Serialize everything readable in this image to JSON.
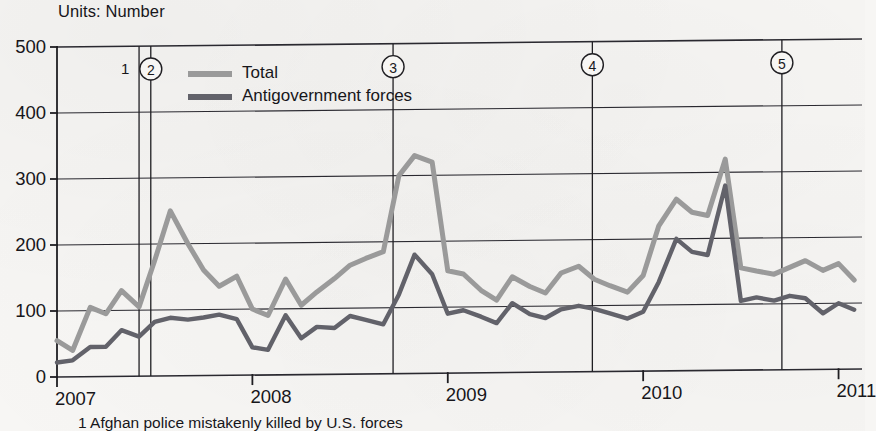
{
  "units_label": "Units: Number",
  "footnote": "1 Afghan police mistakenly killed by U.S. forces",
  "colors": {
    "total_line": "#9a9a9a",
    "antigovernment_line": "#62626a",
    "axis": "#1f1e22",
    "grid": "#2a2930",
    "text": "#17161a",
    "background": "#f7f6f4"
  },
  "legend": {
    "items": [
      {
        "label": "Total",
        "color": "#9a9a9a"
      },
      {
        "label": "Antigovernment forces",
        "color": "#62626a"
      }
    ]
  },
  "annotations": [
    {
      "id": "1",
      "circled": false,
      "x_value": 2007.42
    },
    {
      "id": "2",
      "circled": true,
      "x_value": 2007.48
    },
    {
      "id": "3",
      "circled": true,
      "x_value": 2008.72
    },
    {
      "id": "4",
      "circled": true,
      "x_value": 2009.74
    },
    {
      "id": "5",
      "circled": true,
      "x_value": 2010.71
    }
  ],
  "chart_data": {
    "type": "line",
    "title": "",
    "subtitle": "",
    "xlabel": "",
    "ylabel": "",
    "ylim": [
      0,
      500
    ],
    "xlim": [
      2007.0,
      2011.12
    ],
    "ytick_labels": [
      "0",
      "100",
      "200",
      "300",
      "400",
      "500"
    ],
    "ytick_values": [
      0,
      100,
      200,
      300,
      400,
      500
    ],
    "xtick_labels": [
      "2007",
      "2008",
      "2009",
      "2010",
      "2011"
    ],
    "xtick_values": [
      2007,
      2008,
      2009,
      2010,
      2011
    ],
    "grid": true,
    "legend_position": "top-center",
    "x": [
      2007.0,
      2007.08,
      2007.17,
      2007.25,
      2007.33,
      2007.42,
      2007.5,
      2007.58,
      2007.67,
      2007.75,
      2007.83,
      2007.92,
      2008.0,
      2008.08,
      2008.17,
      2008.25,
      2008.33,
      2008.42,
      2008.5,
      2008.58,
      2008.67,
      2008.75,
      2008.83,
      2008.92,
      2009.0,
      2009.08,
      2009.17,
      2009.25,
      2009.33,
      2009.42,
      2009.5,
      2009.58,
      2009.67,
      2009.75,
      2009.83,
      2009.92,
      2010.0,
      2010.08,
      2010.17,
      2010.25,
      2010.33,
      2010.42,
      2010.5,
      2010.58,
      2010.67,
      2010.75,
      2010.83,
      2010.92,
      2011.0,
      2011.08
    ],
    "series": [
      {
        "name": "Total",
        "color": "#9a9a9a",
        "values": [
          55,
          40,
          105,
          95,
          130,
          105,
          175,
          250,
          200,
          160,
          135,
          150,
          100,
          90,
          145,
          105,
          125,
          145,
          165,
          175,
          185,
          300,
          330,
          320,
          155,
          150,
          125,
          110,
          145,
          130,
          120,
          150,
          160,
          140,
          130,
          120,
          145,
          220,
          260,
          240,
          235,
          320,
          155,
          150,
          145,
          155,
          165,
          150,
          160,
          135
        ]
      },
      {
        "name": "Antigovernment forces",
        "color": "#62626a",
        "values": [
          22,
          25,
          45,
          45,
          70,
          60,
          82,
          88,
          85,
          88,
          92,
          85,
          42,
          38,
          90,
          55,
          72,
          70,
          88,
          82,
          75,
          120,
          180,
          150,
          90,
          95,
          85,
          75,
          105,
          88,
          82,
          95,
          100,
          95,
          88,
          80,
          90,
          135,
          200,
          180,
          175,
          280,
          105,
          110,
          105,
          112,
          108,
          85,
          100,
          90
        ]
      }
    ]
  }
}
